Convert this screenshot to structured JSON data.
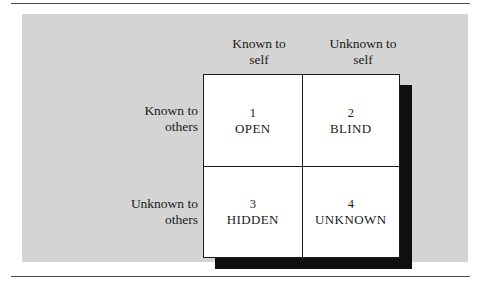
{
  "figure": {
    "panel_color": "#d4d4d4",
    "shadow_color": "#101010",
    "rule_color": "#4a4a4a",
    "grid_border_color": "#1a1a1a",
    "grid_fill_color": "#ffffff"
  },
  "columns": [
    {
      "line1": "Known to",
      "line2": "self"
    },
    {
      "line1": "Unknown to",
      "line2": "self"
    }
  ],
  "rows": [
    {
      "line1": "Known to",
      "line2": "others"
    },
    {
      "line1": "Unknown to",
      "line2": "others"
    }
  ],
  "quadrants": [
    {
      "number": "1",
      "label": "OPEN"
    },
    {
      "number": "2",
      "label": "BLIND"
    },
    {
      "number": "3",
      "label": "HIDDEN"
    },
    {
      "number": "4",
      "label": "UNKNOWN"
    }
  ]
}
